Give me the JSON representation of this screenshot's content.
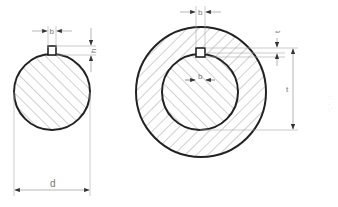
{
  "diagram": {
    "shaft": {
      "label_key_width": "b",
      "label_key_depth": "h",
      "label_diameter": "d"
    },
    "hub": {
      "label_key_width_top": "b",
      "label_key_width_inner": "b",
      "label_t1": "t",
      "label_t": "t"
    },
    "watermark": "·: ·: ·:"
  },
  "colors": {
    "outline": "#222222",
    "hatch": "#8a8a8a",
    "dimension": "#999999",
    "background": "#ffffff"
  }
}
